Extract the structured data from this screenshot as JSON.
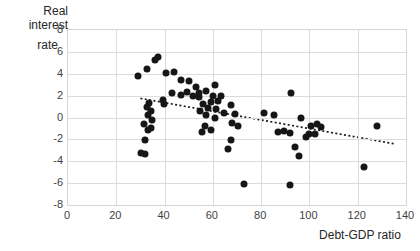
{
  "chart_data": {
    "type": "scatter",
    "title": "",
    "xlabel": "Debt-GDP ratio",
    "ylabel_line1": "Real interest",
    "ylabel_line2": "rate",
    "xlim": [
      0,
      140
    ],
    "ylim": [
      -8,
      8
    ],
    "xticks": [
      0,
      20,
      40,
      60,
      80,
      100,
      120,
      140
    ],
    "yticks": [
      8,
      6,
      4,
      2,
      0,
      -2,
      -4,
      -6,
      -8
    ],
    "grid": true,
    "legend": false,
    "colors": {
      "dot": "#161616",
      "grid": "#dcdcdc",
      "text": "#3f3f3f",
      "trend": "#1a1a1a",
      "background": "#ffffff"
    },
    "points": [
      [
        29.0,
        3.8
      ],
      [
        32.7,
        4.4
      ],
      [
        36.0,
        5.3
      ],
      [
        37.3,
        5.5
      ],
      [
        40.6,
        4.1
      ],
      [
        43.9,
        4.2
      ],
      [
        46.8,
        3.4
      ],
      [
        50.1,
        3.3
      ],
      [
        53.0,
        2.8
      ],
      [
        43.1,
        2.2
      ],
      [
        46.8,
        2.1
      ],
      [
        49.3,
        2.3
      ],
      [
        51.8,
        2.0
      ],
      [
        54.3,
        1.9
      ],
      [
        39.3,
        1.6
      ],
      [
        39.8,
        1.2
      ],
      [
        33.5,
        1.3
      ],
      [
        32.7,
        1.0
      ],
      [
        34.4,
        0.6
      ],
      [
        33.1,
        0.2
      ],
      [
        34.8,
        -0.2
      ],
      [
        31.5,
        -0.6
      ],
      [
        33.1,
        -1.1
      ],
      [
        34.4,
        -1.0
      ],
      [
        31.9,
        -2.1
      ],
      [
        30.2,
        -3.2
      ],
      [
        31.9,
        -3.3
      ],
      [
        60.9,
        3.0
      ],
      [
        57.2,
        2.4
      ],
      [
        54.3,
        2.2
      ],
      [
        60.1,
        2.0
      ],
      [
        63.4,
        2.0
      ],
      [
        62.1,
        1.5
      ],
      [
        59.2,
        1.4
      ],
      [
        55.9,
        1.2
      ],
      [
        58.0,
        0.9
      ],
      [
        61.3,
        0.8
      ],
      [
        54.7,
        0.6
      ],
      [
        57.2,
        0.2
      ],
      [
        60.9,
        0.0
      ],
      [
        64.6,
        0.4
      ],
      [
        67.5,
        1.1
      ],
      [
        69.2,
        0.3
      ],
      [
        67.9,
        -0.5
      ],
      [
        70.4,
        -0.8
      ],
      [
        56.7,
        -0.8
      ],
      [
        59.2,
        -1.1
      ],
      [
        55.5,
        -1.3
      ],
      [
        67.5,
        -2.1
      ],
      [
        66.3,
        -2.9
      ],
      [
        72.9,
        -6.1
      ],
      [
        81.2,
        0.4
      ],
      [
        85.3,
        0.2
      ],
      [
        92.4,
        2.2
      ],
      [
        96.5,
        0.0
      ],
      [
        87.0,
        -1.3
      ],
      [
        89.5,
        -1.2
      ],
      [
        92.0,
        -1.4
      ],
      [
        94.0,
        -2.7
      ],
      [
        95.7,
        -3.5
      ],
      [
        92.0,
        -6.2
      ],
      [
        100.7,
        -0.8
      ],
      [
        103.1,
        -0.6
      ],
      [
        104.8,
        -0.9
      ],
      [
        99.8,
        -1.5
      ],
      [
        102.3,
        -1.5
      ],
      [
        98.6,
        -1.8
      ],
      [
        128.0,
        -0.8
      ],
      [
        122.7,
        -4.5
      ]
    ],
    "trendline": {
      "x1": 30,
      "y1": 1.75,
      "x2": 135,
      "y2": -2.4,
      "style": "dotted"
    }
  }
}
